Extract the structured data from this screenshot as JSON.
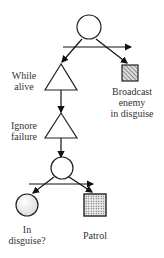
{
  "diagram": {
    "nodes": [
      {
        "id": "root",
        "type": "selector",
        "shape": "circle"
      },
      {
        "id": "while_alive",
        "type": "decorator",
        "shape": "triangle",
        "label": "While alive"
      },
      {
        "id": "broadcast",
        "type": "action",
        "shape": "square-hatched",
        "label": "Broadcast enemy in disguise"
      },
      {
        "id": "ignore_failure",
        "type": "decorator",
        "shape": "triangle",
        "label": "Ignore failure"
      },
      {
        "id": "seq2",
        "type": "selector",
        "shape": "circle"
      },
      {
        "id": "in_disguise",
        "type": "condition",
        "shape": "circle",
        "label": "In disguise?"
      },
      {
        "id": "patrol",
        "type": "action",
        "shape": "square-dotted",
        "label": "Patrol"
      }
    ],
    "labels": {
      "while_alive_1": "While",
      "while_alive_2": "alive",
      "ignore_1": "Ignore",
      "ignore_2": "failure",
      "broadcast_1": "Broadcast",
      "broadcast_2": "enemy",
      "broadcast_3": "in disguise",
      "in_disguise_1": "In",
      "in_disguise_2": "disguise?",
      "patrol": "Patrol"
    }
  }
}
